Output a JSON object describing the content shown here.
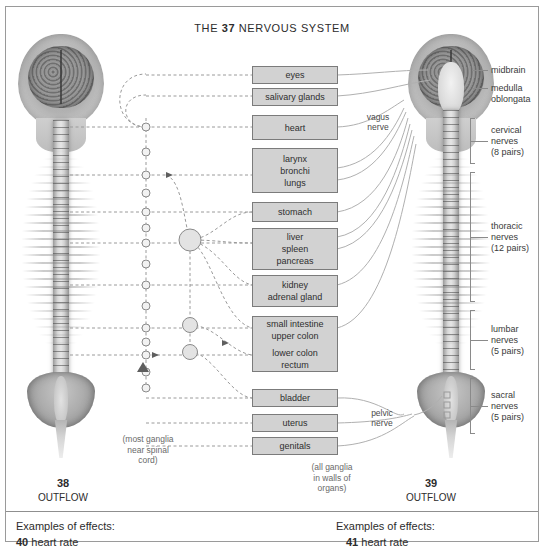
{
  "title": {
    "prefix": "THE ",
    "number": "37",
    "suffix": " NERVOUS SYSTEM"
  },
  "organ_boxes": [
    {
      "id": "eyes",
      "lines": [
        "eyes"
      ]
    },
    {
      "id": "salivary-glands",
      "lines": [
        "salivary glands"
      ]
    },
    {
      "id": "heart",
      "lines": [
        "heart"
      ]
    },
    {
      "id": "larynx-bronchi-lungs",
      "lines": [
        "larynx",
        "bronchi",
        "lungs"
      ]
    },
    {
      "id": "stomach",
      "lines": [
        "stomach"
      ]
    },
    {
      "id": "liver-spleen-pancreas",
      "lines": [
        "liver",
        "spleen",
        "pancreas"
      ]
    },
    {
      "id": "kidney-adrenal-gland",
      "lines": [
        "kidney",
        "adrenal gland"
      ]
    },
    {
      "id": "intestine-colon-rectum",
      "lines": [
        "small intestine",
        "upper colon",
        "",
        "lower colon",
        "rectum"
      ]
    },
    {
      "id": "bladder",
      "lines": [
        "bladder"
      ]
    },
    {
      "id": "uterus",
      "lines": [
        "uterus"
      ]
    },
    {
      "id": "genitals",
      "lines": [
        "genitals"
      ]
    }
  ],
  "right_labels": [
    {
      "id": "midbrain",
      "lines": [
        "midbrain"
      ]
    },
    {
      "id": "medulla-oblongata",
      "lines": [
        "medulla",
        "oblongata"
      ]
    },
    {
      "id": "cervical-nerves",
      "lines": [
        "cervical",
        "nerves",
        "(8 pairs)"
      ]
    },
    {
      "id": "thoracic-nerves",
      "lines": [
        "thoracic",
        "nerves",
        "(12 pairs)"
      ]
    },
    {
      "id": "lumbar-nerves",
      "lines": [
        "lumbar",
        "nerves",
        "(5 pairs)"
      ]
    },
    {
      "id": "sacral-nerves",
      "lines": [
        "sacral",
        "nerves",
        "(5 pairs)"
      ]
    }
  ],
  "nerve_labels": [
    {
      "id": "vagus-nerve",
      "lines": [
        "vagus",
        "nerve"
      ]
    },
    {
      "id": "pelvic-nerve",
      "lines": [
        "pelvic",
        "nerve"
      ]
    }
  ],
  "notes": [
    {
      "id": "sympathetic-ganglia-note",
      "lines": [
        "(most ganglia",
        "near spinal",
        "cord)"
      ]
    },
    {
      "id": "parasympathetic-ganglia-note",
      "lines": [
        "(all ganglia",
        "in walls of",
        "organs)"
      ]
    }
  ],
  "outflows": [
    {
      "id": "left-outflow",
      "number": "38",
      "label": "OUTFLOW"
    },
    {
      "id": "right-outflow",
      "number": "39",
      "label": "OUTFLOW"
    }
  ],
  "effects": [
    {
      "id": "left-effects",
      "heading": "Examples of effects:",
      "number": "40",
      "text": " heart rate"
    },
    {
      "id": "right-effects",
      "heading": "Examples of effects:",
      "number": "41",
      "text": " heart rate"
    }
  ],
  "colors": {
    "box_fill": "#d2d2d2",
    "box_border": "#7b7b7b",
    "line": "#9a9a9a",
    "frame": "#9a9a9a",
    "text": "#2c2c2c"
  }
}
